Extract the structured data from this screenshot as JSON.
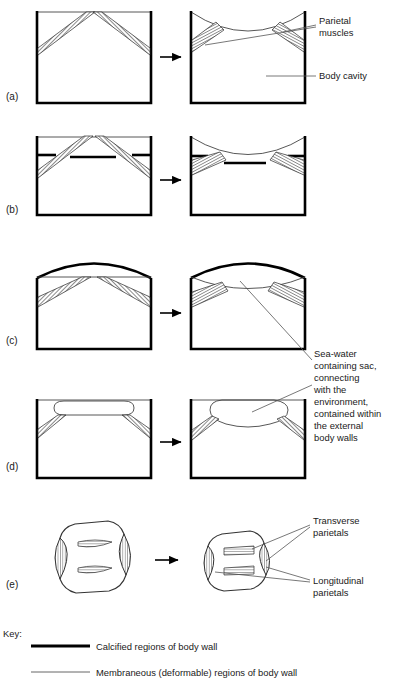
{
  "figure": {
    "type": "biological-diagram",
    "panels": [
      {
        "id": "a",
        "letter": "(a)",
        "description": "Rectangular body with membraneous roof; relaxed then contracted parietal muscles pull roof concave"
      },
      {
        "id": "b",
        "letter": "(b)",
        "description": "Body with calcified plate segments in roof region; muscle contraction bows roof inward"
      },
      {
        "id": "c",
        "letter": "(c)",
        "description": "Body with arched calcified dome roof and membrane below; contraction lowers the membrane"
      },
      {
        "id": "d",
        "letter": "(d)",
        "description": "Body with a flattened sea-water sac at roof; contraction makes the sac bulge downward"
      },
      {
        "id": "e",
        "letter": "(e)",
        "description": "Three-dimensional cylinder with transverse and longitudinal parietal muscles; contraction shortens and narrows the cylinder"
      }
    ]
  },
  "callouts": {
    "parietal_muscles": "Parietal\nmuscles",
    "parietal_muscles_line1": "Parietal",
    "parietal_muscles_line2": "muscles",
    "body_cavity": "Body cavity",
    "seawater_sac_lines": [
      "Sea-water",
      "containing sac,",
      "connecting",
      "with the",
      "environment,",
      "contained within",
      "the external",
      "body walls"
    ],
    "transverse_parietals_lines": [
      "Transverse",
      "parietals"
    ],
    "longitudinal_parietals_lines": [
      "Longitudinal",
      "parietals"
    ]
  },
  "key": {
    "title": "Key:",
    "entries": [
      {
        "swatch": "thick-black-line",
        "label": "Calcified regions of body wall"
      },
      {
        "swatch": "thin-grey-line",
        "label": "Membraneous (deformable) regions of body wall"
      }
    ]
  },
  "colors": {
    "calcified": "#000000",
    "membrane": "#444444",
    "muscle_hatch": "#2b2b2b",
    "leader": "#555555",
    "text": "#1a1a1a",
    "background": "#ffffff"
  }
}
